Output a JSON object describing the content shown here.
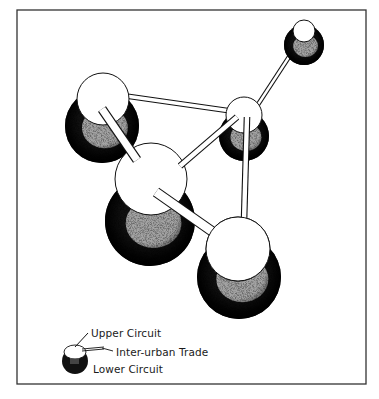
{
  "figure": {
    "frame": {
      "x": 17,
      "y": 10,
      "width": 349,
      "height": 374
    },
    "colors": {
      "ink": "#111111",
      "cap": "#ffffff",
      "stipple": "#bdbdbd",
      "background": "#ffffff"
    },
    "nodes": [
      {
        "id": "A",
        "name": "upper-left-city",
        "cap": {
          "cx": 103,
          "cy": 99,
          "r": 26
        },
        "sphere": {
          "cx": 102,
          "cy": 126,
          "r": 37
        }
      },
      {
        "id": "B",
        "name": "right-middle-city",
        "cap": {
          "cx": 244,
          "cy": 115,
          "r": 18
        },
        "sphere": {
          "cx": 244,
          "cy": 136,
          "r": 25
        }
      },
      {
        "id": "C",
        "name": "top-right-city",
        "cap": {
          "cx": 304,
          "cy": 31,
          "r": 11
        },
        "sphere": {
          "cx": 304,
          "cy": 45,
          "r": 20
        }
      },
      {
        "id": "D",
        "name": "central-city",
        "cap": {
          "cx": 151,
          "cy": 179,
          "r": 36
        },
        "sphere": {
          "cx": 150,
          "cy": 221,
          "r": 45
        }
      },
      {
        "id": "E",
        "name": "lower-right-city",
        "cap": {
          "cx": 238,
          "cy": 249,
          "r": 32
        },
        "sphere": {
          "cx": 239,
          "cy": 277,
          "r": 42
        }
      }
    ],
    "links": [
      {
        "from": "A",
        "to": "B",
        "x1": 126,
        "y1": 96,
        "x2": 231,
        "y2": 111,
        "w": 4
      },
      {
        "from": "A",
        "to": "D",
        "x1": 102,
        "y1": 109,
        "x2": 137,
        "y2": 160,
        "w": 8
      },
      {
        "from": "D",
        "to": "B",
        "x1": 180,
        "y1": 166,
        "x2": 237,
        "y2": 117,
        "w": 5
      },
      {
        "from": "D",
        "to": "E",
        "x1": 156,
        "y1": 192,
        "x2": 213,
        "y2": 232,
        "w": 9
      },
      {
        "from": "B",
        "to": "E",
        "x1": 247,
        "y1": 117,
        "x2": 244,
        "y2": 221,
        "w": 5
      },
      {
        "from": "B",
        "to": "C",
        "x1": 257,
        "y1": 106,
        "x2": 302,
        "y2": 37,
        "w": 3
      }
    ]
  },
  "legend": {
    "upper": "Upper Circuit",
    "trade": "Inter-urban Trade",
    "lower": "Lower Circuit"
  }
}
